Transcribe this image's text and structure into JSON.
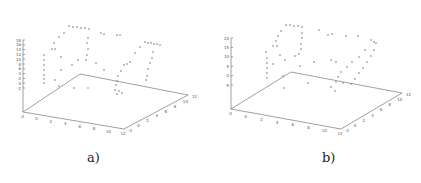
{
  "figure": {
    "captions": [
      "a)",
      "b)"
    ]
  },
  "chart_data": [
    {
      "type": "scatter",
      "title": "",
      "panel": "a)",
      "dimensions": "3d",
      "xlabel": "",
      "ylabel": "",
      "zlabel": "",
      "x_ticks": [
        "-2",
        "0",
        "2",
        "4",
        "6",
        "8",
        "10",
        "12"
      ],
      "y_ticks": [
        "-2",
        "0",
        "2",
        "4",
        "6",
        "8",
        "10",
        "12"
      ],
      "z_ticks": [
        "-2",
        "0",
        "2",
        "4",
        "6",
        "8",
        "10",
        "12",
        "14",
        "16",
        "18"
      ],
      "xlim": [
        -2,
        12
      ],
      "ylim": [
        -2,
        12
      ],
      "zlim": [
        -2,
        18
      ],
      "grid": false,
      "marker": "+",
      "description": "Sparse 3D point cloud tracing two loop-like wireframe contours above a flat base plane",
      "screen_points": [
        [
          69,
          26
        ],
        [
          73,
          27
        ],
        [
          77,
          27
        ],
        [
          81,
          28
        ],
        [
          85,
          28
        ],
        [
          89,
          29
        ],
        [
          64,
          33
        ],
        [
          101,
          33
        ],
        [
          104,
          34
        ],
        [
          117,
          35
        ],
        [
          120,
          35
        ],
        [
          59,
          37
        ],
        [
          88,
          38
        ],
        [
          54,
          43
        ],
        [
          87,
          43
        ],
        [
          52,
          49
        ],
        [
          55,
          49
        ],
        [
          145,
          42
        ],
        [
          148,
          43
        ],
        [
          151,
          43
        ],
        [
          154,
          44
        ],
        [
          157,
          44
        ],
        [
          160,
          45
        ],
        [
          88,
          49
        ],
        [
          140,
          47
        ],
        [
          44,
          55
        ],
        [
          87,
          55
        ],
        [
          135,
          53
        ],
        [
          153,
          52
        ],
        [
          44,
          60
        ],
        [
          86,
          60
        ],
        [
          61,
          57
        ],
        [
          152,
          58
        ],
        [
          44,
          65
        ],
        [
          78,
          60
        ],
        [
          130,
          62
        ],
        [
          96,
          63
        ],
        [
          150,
          63
        ],
        [
          44,
          70
        ],
        [
          72,
          65
        ],
        [
          124,
          65
        ],
        [
          127,
          64
        ],
        [
          44,
          75
        ],
        [
          61,
          70
        ],
        [
          121,
          71
        ],
        [
          148,
          69
        ],
        [
          44,
          79
        ],
        [
          104,
          70
        ],
        [
          118,
          76
        ],
        [
          44,
          83
        ],
        [
          55,
          80
        ],
        [
          117,
          81
        ],
        [
          147,
          76
        ],
        [
          59,
          86
        ],
        [
          116,
          85
        ],
        [
          146,
          80
        ],
        [
          74,
          88
        ],
        [
          115,
          90
        ],
        [
          119,
          91
        ],
        [
          88,
          88
        ],
        [
          117,
          94
        ],
        [
          122,
          93
        ]
      ]
    },
    {
      "type": "scatter",
      "title": "",
      "panel": "b)",
      "dimensions": "3d",
      "xlabel": "",
      "ylabel": "",
      "zlabel": "",
      "x_ticks": [
        "-2",
        "0",
        "2",
        "4",
        "6",
        "8",
        "10",
        "12"
      ],
      "y_ticks": [
        "-2",
        "0",
        "2",
        "4",
        "6",
        "8",
        "10",
        "12"
      ],
      "z_ticks": [
        "-5",
        "0",
        "5",
        "10",
        "15",
        "20"
      ],
      "xlim": [
        -2,
        12
      ],
      "ylim": [
        -2,
        12
      ],
      "zlim": [
        -5,
        20
      ],
      "grid": false,
      "marker": "+",
      "description": "Sparse 3D point cloud tracing two loop-like wireframe contours above a flat base plane; z range extended to 20",
      "screen_points": [
        [
          75,
          25
        ],
        [
          79,
          25
        ],
        [
          83,
          26
        ],
        [
          87,
          26
        ],
        [
          91,
          27
        ],
        [
          70,
          31
        ],
        [
          108,
          30
        ],
        [
          117,
          35
        ],
        [
          121,
          34
        ],
        [
          67,
          36
        ],
        [
          91,
          33
        ],
        [
          65,
          41
        ],
        [
          91,
          38
        ],
        [
          62,
          46
        ],
        [
          66,
          46
        ],
        [
          90,
          44
        ],
        [
          135,
          36
        ],
        [
          147,
          36
        ],
        [
          160,
          40
        ],
        [
          163,
          42
        ],
        [
          165,
          43
        ],
        [
          55,
          52
        ],
        [
          90,
          49
        ],
        [
          154,
          50
        ],
        [
          56,
          58
        ],
        [
          88,
          54
        ],
        [
          84,
          56
        ],
        [
          148,
          57
        ],
        [
          163,
          50
        ],
        [
          56,
          63
        ],
        [
          69,
          55
        ],
        [
          120,
          60
        ],
        [
          141,
          62
        ],
        [
          160,
          56
        ],
        [
          56,
          68
        ],
        [
          74,
          60
        ],
        [
          125,
          62
        ],
        [
          136,
          67
        ],
        [
          156,
          62
        ],
        [
          56,
          73
        ],
        [
          62,
          64
        ],
        [
          103,
          62
        ],
        [
          130,
          72
        ],
        [
          152,
          68
        ],
        [
          56,
          78
        ],
        [
          89,
          66
        ],
        [
          127,
          77
        ],
        [
          148,
          73
        ],
        [
          72,
          76
        ],
        [
          125,
          82
        ],
        [
          144,
          79
        ],
        [
          97,
          83
        ],
        [
          120,
          87
        ],
        [
          140,
          84
        ],
        [
          73,
          88
        ],
        [
          132,
          83
        ],
        [
          124,
          91
        ]
      ]
    }
  ]
}
